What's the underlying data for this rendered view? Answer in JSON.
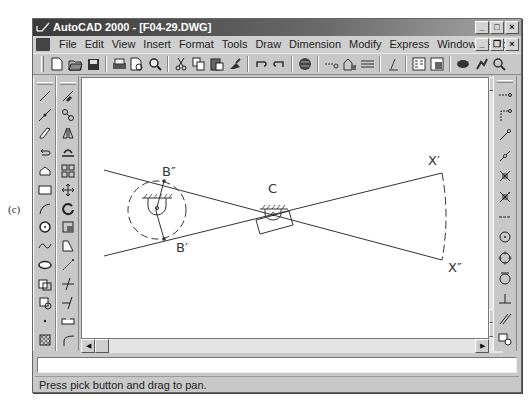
{
  "figure": {
    "label": "(c)"
  },
  "window": {
    "title": "AutoCAD 2000 - [F04-29.DWG]",
    "title_buttons": [
      "minimize",
      "maximize",
      "close"
    ],
    "document_buttons": [
      "minimize",
      "restore",
      "close"
    ]
  },
  "menubar": {
    "items": [
      {
        "label": "File"
      },
      {
        "label": "Edit"
      },
      {
        "label": "View"
      },
      {
        "label": "Insert"
      },
      {
        "label": "Format"
      },
      {
        "label": "Tools"
      },
      {
        "label": "Draw"
      },
      {
        "label": "Dimension"
      },
      {
        "label": "Modify"
      },
      {
        "label": "Express"
      },
      {
        "label": "Window"
      },
      {
        "label": "Help"
      }
    ]
  },
  "standard_toolbar": {
    "icons": [
      "new-icon",
      "open-icon",
      "save-icon",
      "|",
      "print-icon",
      "print-preview-icon",
      "find-icon",
      "|",
      "cut-icon",
      "copy-icon",
      "paste-icon",
      "match-properties-icon",
      "|",
      "undo-icon",
      "redo-icon",
      "|",
      "web-browser-icon",
      "|",
      "snap-from-icon",
      "object-tracking-icon",
      "ucs-icon",
      "|",
      "distance-icon",
      "|",
      "properties-icon",
      "design-center-icon",
      "|",
      "pan-icon",
      "zoom-realtime-icon",
      "zoom-window-icon"
    ]
  },
  "draw_toolbar": {
    "icons": [
      "line-icon",
      "construction-line-icon",
      "polyline-icon",
      "polygon-icon",
      "rectangle-icon",
      "arc-icon",
      "circle-icon",
      "spline-icon",
      "ellipse-icon",
      "insert-block-icon",
      "make-block-icon",
      "point-icon",
      "hatch-icon"
    ]
  },
  "modify_toolbar": {
    "icons": [
      "erase-icon",
      "copy-object-icon",
      "mirror-icon",
      "offset-icon",
      "array-icon",
      "move-icon",
      "rotate-icon",
      "scale-icon",
      "stretch-icon",
      "lengthen-icon",
      "trim-icon",
      "extend-icon",
      "break-icon",
      "fillet-icon"
    ]
  },
  "osnap_toolbar": {
    "icons": [
      "temp-tracking-icon",
      "snap-from-icon",
      "snap-endpoint-icon",
      "snap-midpoint-icon",
      "snap-intersection-icon",
      "snap-apparent-intersection-icon",
      "snap-extension-icon",
      "snap-center-icon",
      "snap-quadrant-icon",
      "snap-tangent-icon",
      "snap-perpendicular-icon",
      "snap-parallel-icon",
      "snap-insert-icon"
    ]
  },
  "drawing": {
    "labels": {
      "b_double_prime": "B″",
      "b_prime": "B′",
      "c": "C",
      "x_prime": "X′",
      "x_double_prime": "X″"
    }
  },
  "command_line": {
    "value": ""
  },
  "status": {
    "message": "Press pick button and drag to pan."
  }
}
